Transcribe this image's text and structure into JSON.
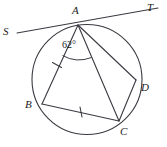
{
  "figure": {
    "type": "circle-geometry-diagram",
    "stroke_color": "#3a3a42",
    "background_color": "#ffffff",
    "text_color": "#1a1a1a"
  },
  "circle": {
    "center_x": 87,
    "center_y": 79.5,
    "radius": 55
  },
  "points": [
    {
      "id": "A",
      "label": "A",
      "x": 78,
      "y": 25,
      "label_x": 72,
      "label_y": 6
    },
    {
      "id": "B",
      "label": "B",
      "x": 42,
      "y": 104,
      "label_x": 25,
      "label_y": 101
    },
    {
      "id": "C",
      "label": "C",
      "x": 119,
      "y": 121,
      "label_x": 120,
      "label_y": 126
    },
    {
      "id": "D",
      "label": "D",
      "x": 136,
      "y": 80,
      "label_x": 140,
      "label_y": 82
    },
    {
      "id": "S",
      "label": "S",
      "x": 17,
      "y": 33,
      "label_x": 3,
      "label_y": 26
    },
    {
      "id": "T",
      "label": "T",
      "x": 158,
      "y": 8,
      "label_x": 146,
      "label_y": 3
    }
  ],
  "segments": [
    {
      "name": "secant-ST",
      "from": "S",
      "to": "T"
    },
    {
      "name": "chord-AB",
      "from": "A",
      "to": "B",
      "ticks": 1
    },
    {
      "name": "chord-AC",
      "from": "A",
      "to": "C",
      "ticks": 0
    },
    {
      "name": "chord-AD",
      "from": "A",
      "to": "D",
      "ticks": 0
    },
    {
      "name": "chord-BC",
      "from": "B",
      "to": "C",
      "ticks": 1
    },
    {
      "name": "chord-CD",
      "from": "C",
      "to": "D",
      "ticks": 0
    }
  ],
  "angles": [
    {
      "name": "angle-BAC",
      "vertex": "A",
      "value": "62°",
      "label_x": 60,
      "label_y": 41
    }
  ],
  "tick_marks": [
    {
      "name": "tick-on-AB",
      "x": 57,
      "y": 65,
      "rotation": -25
    },
    {
      "name": "tick-on-BC",
      "x": 81,
      "y": 112,
      "rotation": 78
    }
  ]
}
